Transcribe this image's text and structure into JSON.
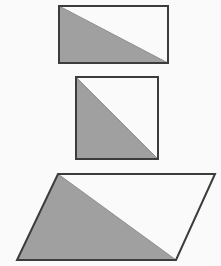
{
  "figure": {
    "title": "",
    "background_color": "#fafafa",
    "width": 221,
    "height": 266,
    "fill_color": "#a0a0a0",
    "stroke_color": "#3c3c3c",
    "stroke_width": 2,
    "diagonal_color": "#8f8f8f",
    "shapes": [
      {
        "id": "shape-1",
        "name": "rectangle",
        "label": "rectangle",
        "outline_points": "59,6 168,6 168,63 59,63",
        "shaded_points": "59,6 168,63 59,63",
        "diagonal": {
          "x1": 59,
          "y1": 6,
          "x2": 168,
          "y2": 63
        },
        "shaded_half": "lower-left",
        "width": 109,
        "height": 57
      },
      {
        "id": "shape-2",
        "name": "square",
        "label": "square",
        "outline_points": "76,77 158,77 158,159 76,159",
        "shaded_points": "76,77 158,159 76,159",
        "diagonal": {
          "x1": 76,
          "y1": 77,
          "x2": 158,
          "y2": 159
        },
        "shaded_half": "lower-left",
        "width": 82,
        "height": 82
      },
      {
        "id": "shape-3",
        "name": "parallelogram",
        "label": "parallelogram",
        "outline_points": "58,174 215,174 176,260 17,260",
        "shaded_points": "58,174 176,260 17,260",
        "diagonal": {
          "x1": 58,
          "y1": 174,
          "x2": 176,
          "y2": 260
        },
        "shaded_half": "lower-left",
        "width": 159,
        "height": 86
      }
    ]
  }
}
